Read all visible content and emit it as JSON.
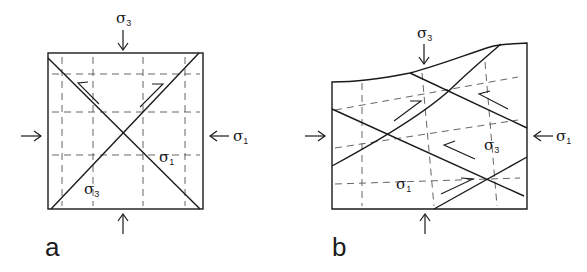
{
  "figure": {
    "panels": [
      {
        "id": "a",
        "label": "a",
        "description": "Square block with conjugate shear fractures under compression",
        "stress_labels": {
          "top": {
            "symbol": "σ",
            "subscript": "3"
          },
          "right": {
            "symbol": "σ",
            "subscript": "1"
          },
          "inner_right": {
            "symbol": "σ",
            "subscript": "1"
          },
          "inner_bottom_left": {
            "symbol": "σ",
            "subscript": "3"
          }
        },
        "arrows": [
          "top-down",
          "bottom-up",
          "left-right",
          "right-left"
        ],
        "shear_sense": [
          "sinistral",
          "dextral"
        ]
      },
      {
        "id": "b",
        "label": "b",
        "description": "Irregular block with irregular top surface, multiple conjugate fractures",
        "stress_labels": {
          "top": {
            "symbol": "σ",
            "subscript": "3"
          },
          "right": {
            "symbol": "σ",
            "subscript": "1"
          },
          "inner_right": {
            "symbol": "σ",
            "subscript": "3"
          },
          "inner_bottom": {
            "symbol": "σ",
            "subscript": "1"
          }
        },
        "arrows": [
          "top-down",
          "bottom-up",
          "left-right",
          "right-left"
        ],
        "shear_sense": [
          "dextral",
          "sinistral",
          "sinistral",
          "dextral"
        ]
      }
    ],
    "colors": {
      "ink": "#1a1a1a",
      "dash": "#555555",
      "background": "#ffffff"
    }
  }
}
